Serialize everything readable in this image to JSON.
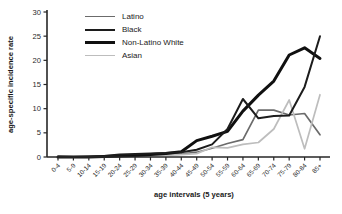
{
  "chart_data": {
    "type": "line",
    "title": "",
    "xlabel": "age intervals (5 years)",
    "ylabel": "age-specific incidence rate",
    "ylim": [
      0,
      30
    ],
    "yticks": [
      0,
      5,
      10,
      15,
      20,
      25,
      30
    ],
    "grid": false,
    "legend_position": "top-left",
    "categories": [
      "0-4",
      "5-9",
      "10-14",
      "15-19",
      "20-24",
      "25-29",
      "30-34",
      "35-39",
      "40-44",
      "45-49",
      "50-54",
      "55-59",
      "60-64",
      "65-69",
      "70-74",
      "75-79",
      "80-84",
      "85+"
    ],
    "series": [
      {
        "name": "Latino",
        "color": "#6b6b6b",
        "stroke_width": 1.7,
        "values": [
          0,
          0,
          0,
          0.1,
          0.2,
          0.3,
          0.4,
          0.5,
          0.6,
          1.0,
          1.8,
          2.8,
          3.6,
          9.7,
          9.7,
          8.7,
          9.0,
          4.6
        ]
      },
      {
        "name": "Black",
        "color": "#1c1c1c",
        "stroke_width": 2,
        "values": [
          0.1,
          0,
          0.1,
          0.2,
          0.5,
          0.6,
          0.7,
          0.8,
          1.0,
          1.5,
          2.6,
          5.8,
          12.0,
          8.0,
          8.5,
          8.6,
          14.5,
          25.0
        ]
      },
      {
        "name": "Non-Latino White",
        "color": "#101010",
        "stroke_width": 3,
        "values": [
          0,
          0,
          0,
          0.1,
          0.2,
          0.3,
          0.5,
          0.7,
          1.1,
          3.4,
          4.3,
          5.3,
          9.5,
          12.8,
          15.7,
          21.1,
          22.6,
          20.4
        ]
      },
      {
        "name": "Asian",
        "color": "#bdbdbd",
        "stroke_width": 1.7,
        "values": [
          0,
          0,
          0,
          0,
          0.1,
          0.2,
          0.3,
          0.4,
          0.5,
          0.7,
          2.0,
          1.9,
          2.6,
          3.0,
          5.8,
          11.8,
          1.7,
          12.9
        ]
      }
    ]
  },
  "colors": {
    "axis": "#262626",
    "background": "#ffffff"
  }
}
